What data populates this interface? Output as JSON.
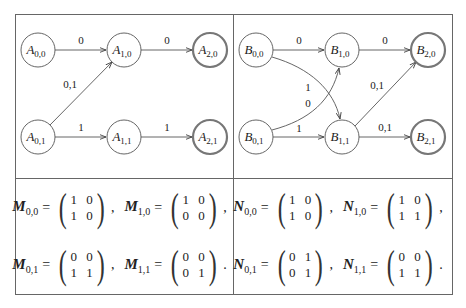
{
  "automaton_A": {
    "nodes": [
      {
        "id": "A00",
        "base": "A",
        "sub": "0,0",
        "accepting": false
      },
      {
        "id": "A10",
        "base": "A",
        "sub": "1,0",
        "accepting": false
      },
      {
        "id": "A20",
        "base": "A",
        "sub": "2,0",
        "accepting": true
      },
      {
        "id": "A01",
        "base": "A",
        "sub": "0,1",
        "accepting": false
      },
      {
        "id": "A11",
        "base": "A",
        "sub": "1,1",
        "accepting": false
      },
      {
        "id": "A21",
        "base": "A",
        "sub": "2,1",
        "accepting": true
      }
    ],
    "edges": [
      {
        "from": "A00",
        "to": "A10",
        "label": "0"
      },
      {
        "from": "A10",
        "to": "A20",
        "label": "0"
      },
      {
        "from": "A01",
        "to": "A10",
        "label": "0,1"
      },
      {
        "from": "A01",
        "to": "A11",
        "label": "1"
      },
      {
        "from": "A11",
        "to": "A21",
        "label": "1"
      }
    ]
  },
  "automaton_B": {
    "nodes": [
      {
        "id": "B00",
        "base": "B",
        "sub": "0,0",
        "accepting": false
      },
      {
        "id": "B10",
        "base": "B",
        "sub": "1,0",
        "accepting": false
      },
      {
        "id": "B20",
        "base": "B",
        "sub": "2,0",
        "accepting": true
      },
      {
        "id": "B01",
        "base": "B",
        "sub": "0,1",
        "accepting": false
      },
      {
        "id": "B11",
        "base": "B",
        "sub": "1,1",
        "accepting": false
      },
      {
        "id": "B21",
        "base": "B",
        "sub": "2,1",
        "accepting": true
      }
    ],
    "edges": [
      {
        "from": "B00",
        "to": "B10",
        "label": "0"
      },
      {
        "from": "B10",
        "to": "B20",
        "label": "0"
      },
      {
        "from": "B00",
        "to": "B11",
        "label": "1"
      },
      {
        "from": "B01",
        "to": "B10",
        "label": "0"
      },
      {
        "from": "B01",
        "to": "B11",
        "label": "1"
      },
      {
        "from": "B11",
        "to": "B20",
        "label": "0,1"
      },
      {
        "from": "B11",
        "to": "B21",
        "label": "0,1"
      }
    ]
  },
  "labels": {
    "A00": {
      "base": "A",
      "sub": "0,0"
    },
    "A10": {
      "base": "A",
      "sub": "1,0"
    },
    "A20": {
      "base": "A",
      "sub": "2,0"
    },
    "A01": {
      "base": "A",
      "sub": "0,1"
    },
    "A11": {
      "base": "A",
      "sub": "1,1"
    },
    "A21": {
      "base": "A",
      "sub": "2,1"
    },
    "B00": {
      "base": "B",
      "sub": "0,0"
    },
    "B10": {
      "base": "B",
      "sub": "1,0"
    },
    "B20": {
      "base": "B",
      "sub": "2,0"
    },
    "B01": {
      "base": "B",
      "sub": "0,1"
    },
    "B11": {
      "base": "B",
      "sub": "1,1"
    },
    "B21": {
      "base": "B",
      "sub": "2,1"
    },
    "eA00_A10": "0",
    "eA10_A20": "0",
    "eA01_A10": "0,1",
    "eA01_A11": "1",
    "eA11_A21": "1",
    "eB00_B10": "0",
    "eB10_B20": "0",
    "eB00_B11": "1",
    "eB01_B10": "0",
    "eB01_B11": "1",
    "eB11_B20": "0,1",
    "eB11_B21": "0,1"
  },
  "matrices_M": {
    "name": "M",
    "m00": {
      "sub": "0,0",
      "row1": "1 0",
      "row2": "1 0",
      "punct": ","
    },
    "m10": {
      "sub": "1,0",
      "row1": "1 0",
      "row2": "0 0",
      "punct": ","
    },
    "m01": {
      "sub": "0,1",
      "row1": "0 0",
      "row2": "1 1",
      "punct": ","
    },
    "m11": {
      "sub": "1,1",
      "row1": "0 0",
      "row2": "0 1",
      "punct": "."
    }
  },
  "matrices_N": {
    "name": "N",
    "n00": {
      "sub": "0,0",
      "row1": "1 0",
      "row2": "1 0",
      "punct": ","
    },
    "n10": {
      "sub": "1,0",
      "row1": "1 0",
      "row2": "1 1",
      "punct": ","
    },
    "n01": {
      "sub": "0,1",
      "row1": "0 1",
      "row2": "0 1",
      "punct": ","
    },
    "n11": {
      "sub": "1,1",
      "row1": "0 0",
      "row2": "1 1",
      "punct": "."
    }
  },
  "symbols": {
    "equals": "="
  },
  "colors": {
    "line": "#555555",
    "accepting_ring": "#777777",
    "text": "#222222"
  }
}
